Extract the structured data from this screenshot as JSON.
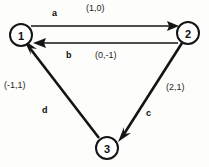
{
  "diagram": {
    "type": "directed-graph",
    "nodes": [
      {
        "id": "1",
        "label": "1",
        "cx": 21,
        "cy": 35,
        "r": 11
      },
      {
        "id": "2",
        "label": "2",
        "cx": 188,
        "cy": 33,
        "r": 11
      },
      {
        "id": "3",
        "label": "3",
        "cx": 107,
        "cy": 148,
        "r": 11
      }
    ],
    "edges": [
      {
        "id": "a",
        "name": "a",
        "from": "1",
        "to": "2",
        "weight": "(1,0)"
      },
      {
        "id": "b",
        "name": "b",
        "from": "2",
        "to": "1",
        "weight": "(0,-1)"
      },
      {
        "id": "c",
        "name": "c",
        "from": "2",
        "to": "3",
        "weight": "(2,1)"
      },
      {
        "id": "d",
        "name": "d",
        "from": "3",
        "to": "1",
        "weight": "(-1,1)"
      }
    ],
    "colors": {
      "stroke": "#141414",
      "node_fill": "#ffffff",
      "background": "#fdfdfc",
      "text": "#0d0d0d"
    }
  }
}
